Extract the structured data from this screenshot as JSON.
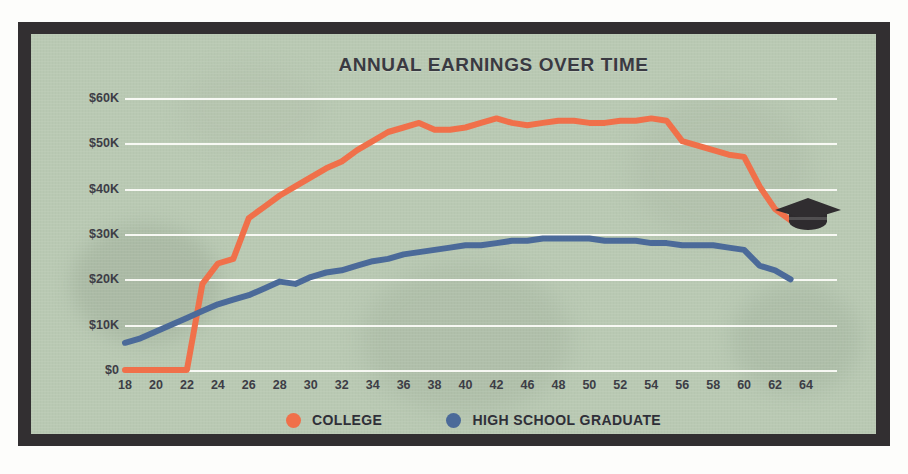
{
  "chart_data": {
    "type": "line",
    "title": "ANNUAL EARNINGS OVER TIME",
    "xlabel": "",
    "ylabel": "",
    "xlim": [
      18,
      64
    ],
    "ylim": [
      0,
      60000
    ],
    "grid": true,
    "legend_position": "bottom",
    "x_tick_labels": [
      "18",
      "20",
      "22",
      "24",
      "26",
      "28",
      "30",
      "32",
      "34",
      "36",
      "38",
      "40",
      "42",
      "46",
      "48",
      "50",
      "52",
      "54",
      "56",
      "58",
      "60",
      "62",
      "64"
    ],
    "x_tick_values": [
      18,
      20,
      22,
      24,
      26,
      28,
      30,
      32,
      34,
      36,
      38,
      40,
      42,
      44,
      46,
      48,
      50,
      52,
      54,
      56,
      58,
      60,
      62
    ],
    "y_tick_labels": [
      "$0",
      "$10K",
      "$20K",
      "$30K",
      "$40K",
      "$50K",
      "$60K"
    ],
    "y_tick_values": [
      0,
      10000,
      20000,
      30000,
      40000,
      50000,
      60000
    ],
    "x": [
      18,
      19,
      20,
      21,
      22,
      23,
      24,
      25,
      26,
      27,
      28,
      29,
      30,
      31,
      32,
      33,
      34,
      35,
      36,
      37,
      38,
      39,
      40,
      41,
      42,
      43,
      44,
      45,
      46,
      47,
      48,
      49,
      50,
      51,
      52,
      53,
      54,
      55,
      56,
      57,
      58,
      59,
      60,
      61
    ],
    "series": [
      {
        "name": "COLLEGE",
        "color": "#f0704a",
        "values": [
          0,
          0,
          0,
          0,
          0,
          19000,
          23500,
          24500,
          33500,
          36000,
          38500,
          40500,
          42500,
          44500,
          46000,
          48500,
          50500,
          52500,
          53500,
          54500,
          53000,
          53000,
          53500,
          54500,
          55500,
          54500,
          54000,
          54500,
          55000,
          55000,
          54500,
          54500,
          55000,
          55000,
          55500,
          55000,
          50500,
          49500,
          48500,
          47500,
          47000,
          40500,
          35500,
          33000
        ]
      },
      {
        "name": "HIGH SCHOOL GRADUATE",
        "color": "#4b6a99",
        "values": [
          6000,
          7000,
          8500,
          10000,
          11500,
          13000,
          14500,
          15500,
          16500,
          18000,
          19500,
          19000,
          20500,
          21500,
          22000,
          23000,
          24000,
          24500,
          25500,
          26000,
          26500,
          27000,
          27500,
          27500,
          28000,
          28500,
          28500,
          29000,
          29000,
          29000,
          29000,
          28500,
          28500,
          28500,
          28000,
          28000,
          27500,
          27500,
          27500,
          27000,
          26500,
          23000,
          22000,
          20000
        ]
      }
    ]
  },
  "legend": {
    "items": [
      {
        "label": "COLLEGE",
        "color": "#f0704a",
        "marker": "circle-dot"
      },
      {
        "label": "HIGH SCHOOL GRADUATE",
        "color": "#4b6a99",
        "marker": "circle-dot"
      }
    ]
  },
  "decorations": {
    "graduation_cap": {
      "icon": "graduation-cap-icon",
      "color": "#2e2b2e"
    }
  },
  "colors": {
    "frame": "#322f31",
    "paper": "#b9c9b3",
    "gridline": "#fdfdfa",
    "text": "#3d3d46",
    "college": "#f0704a",
    "highschool": "#4b6a99"
  }
}
